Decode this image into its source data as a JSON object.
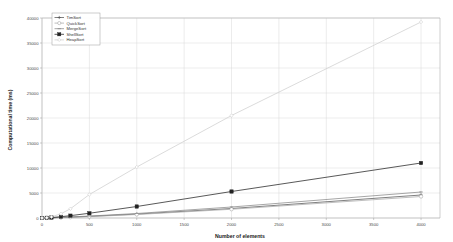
{
  "chart_data": {
    "type": "line",
    "title": "",
    "xlabel": "Number of elements",
    "ylabel": "Computational time (ms)",
    "xlim": [
      0,
      4200
    ],
    "ylim": [
      0,
      40000
    ],
    "grid": true,
    "legend_position": "top-left",
    "xticks": [
      0,
      500,
      1000,
      1500,
      2000,
      2500,
      3000,
      3500,
      4000
    ],
    "xtick_labels": [
      "0",
      "500",
      "1000",
      "1500",
      "2000",
      "2500",
      "3000",
      "3500",
      "4000"
    ],
    "yticks": [
      0,
      5000,
      10000,
      15000,
      20000,
      25000,
      30000,
      35000,
      40000
    ],
    "ytick_labels": [
      "0",
      "5000",
      "10000",
      "15000",
      "20000",
      "25000",
      "30000",
      "35000",
      "40000"
    ],
    "x": [
      0,
      50,
      100,
      200,
      300,
      500,
      1000,
      2000,
      4000
    ],
    "series": [
      {
        "name": "TimSort",
        "color": "#555555",
        "marker": "plus",
        "values": [
          0,
          20,
          45,
          110,
          180,
          330,
          780,
          1900,
          4600
        ]
      },
      {
        "name": "QuickSort",
        "color": "#aaaaaa",
        "marker": "circle",
        "values": [
          0,
          15,
          35,
          90,
          150,
          280,
          700,
          1750,
          4300
        ]
      },
      {
        "name": "MergeSort",
        "color": "#888888",
        "marker": "dash",
        "values": [
          0,
          25,
          55,
          130,
          210,
          390,
          900,
          2200,
          5200
        ]
      },
      {
        "name": "ShellSort",
        "color": "#222222",
        "marker": "square",
        "values": [
          0,
          40,
          95,
          260,
          470,
          950,
          2300,
          5300,
          11000
        ]
      },
      {
        "name": "HeapSort",
        "color": "#cfcfcf",
        "marker": "diamond",
        "values": [
          0,
          60,
          220,
          850,
          1850,
          4700,
          10200,
          20500,
          39200
        ]
      }
    ]
  },
  "axes": {
    "ylabel": "Computational time (ms)",
    "xlabel": "Number of elements"
  },
  "legend": {
    "items": [
      {
        "label": "TimSort"
      },
      {
        "label": "QuickSort"
      },
      {
        "label": "MergeSort"
      },
      {
        "label": "ShellSort"
      },
      {
        "label": "HeapSort"
      }
    ]
  }
}
